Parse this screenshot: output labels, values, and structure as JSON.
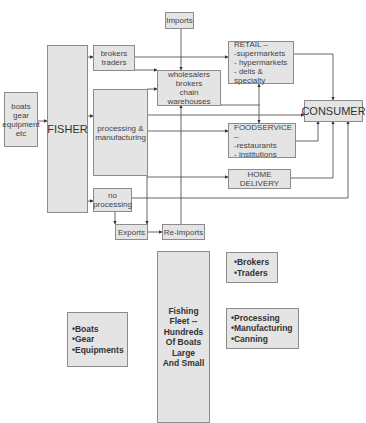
{
  "flow": {
    "imports": "Imports",
    "boats_gear": "boats\ngear\nequipment\netc",
    "fisher": "FISHER",
    "brokers_traders": "brokers\ntraders",
    "wholesalers": "wholesalers\nbrokers\nchain warehouses",
    "processing": "processing &\nmanufacturing",
    "retail": "RETAIL –\n-supermarkets\n- hypermarkets\n- delis & specialty",
    "consumer": "CONSUMER",
    "foodservice": "FOODSERVICE –\n-restaurants\n- institutions",
    "home_delivery": "HOME DELIVERY",
    "no_processing": "no\nprocessing",
    "exports": "Exports",
    "reimports": "Re-Imports"
  },
  "legend": {
    "fleet": "Fishing\nFleet --\nHundreds\nOf Boats\nLarge\nAnd Small",
    "brokers": "•Brokers\n•Traders",
    "boats": "•Boats\n•Gear\n•Equipments",
    "processing": "•Processing\n•Manufacturing\n•Canning"
  }
}
